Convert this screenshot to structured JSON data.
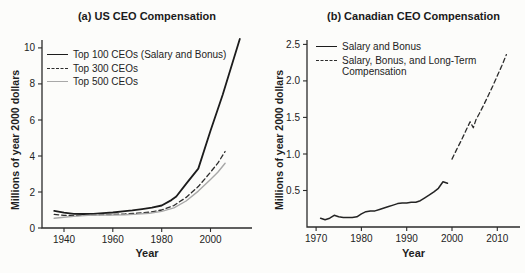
{
  "colors": {
    "background": "#fcfcfa",
    "ink": "#1f1f1f",
    "axis": "#2b2b2b",
    "gray_line": "#a8a8a8"
  },
  "chart_data": [
    {
      "type": "line",
      "title": "(a) US CEO Compensation",
      "xlabel": "Year",
      "ylabel": "Millions of year 2000 dollars",
      "xlim": [
        1931,
        2017
      ],
      "ylim": [
        0,
        10.44
      ],
      "xticks": [
        1940,
        1960,
        1980,
        2000
      ],
      "xtick_labels": [
        "1940",
        "1960",
        "1980",
        "2000"
      ],
      "yticks": [
        0,
        2,
        4,
        6,
        8,
        10
      ],
      "ytick_labels": [
        "0",
        "2",
        "4",
        "6",
        "8",
        "10"
      ],
      "grid": false,
      "legend_position": "upper-left-inside",
      "axis_color": "#2b2b2b",
      "series": [
        {
          "name": "Top 100 CEOs (Salary and Bonus)",
          "style": "solid",
          "color": "#1c1c1c",
          "width": 1.8,
          "x": [
            1936,
            1940,
            1944,
            1948,
            1952,
            1956,
            1960,
            1964,
            1968,
            1972,
            1976,
            1980,
            1984,
            1986,
            1990,
            1995,
            2000,
            2005,
            2012
          ],
          "y": [
            0.95,
            0.85,
            0.79,
            0.78,
            0.79,
            0.82,
            0.86,
            0.92,
            0.98,
            1.05,
            1.13,
            1.25,
            1.55,
            1.75,
            2.45,
            3.3,
            5.4,
            7.4,
            10.5
          ]
        },
        {
          "name": "Top 300 CEOs",
          "style": "dashed",
          "color": "#2d2d2d",
          "width": 1.3,
          "x": [
            1936,
            1940,
            1945,
            1950,
            1955,
            1960,
            1965,
            1970,
            1975,
            1980,
            1985,
            1990,
            1995,
            2000,
            2003,
            2006
          ],
          "y": [
            0.76,
            0.7,
            0.69,
            0.72,
            0.74,
            0.75,
            0.78,
            0.82,
            0.88,
            1.0,
            1.25,
            1.7,
            2.3,
            3.1,
            3.6,
            4.25
          ]
        },
        {
          "name": "Top 500 CEOs",
          "style": "solid",
          "color": "#a8a8a8",
          "width": 1.4,
          "x": [
            1936,
            1940,
            1945,
            1950,
            1955,
            1960,
            1965,
            1970,
            1975,
            1980,
            1985,
            1990,
            1995,
            2000,
            2003,
            2006
          ],
          "y": [
            0.54,
            0.6,
            0.66,
            0.7,
            0.72,
            0.72,
            0.74,
            0.77,
            0.82,
            0.92,
            1.12,
            1.5,
            2.05,
            2.7,
            3.1,
            3.6
          ]
        }
      ]
    },
    {
      "type": "line",
      "title": "(b) Canadian CEO Compensation",
      "xlabel": "Year",
      "ylabel": "Millions of year 2000 dollars",
      "xlim": [
        1968,
        2015
      ],
      "ylim": [
        0,
        2.56
      ],
      "xticks": [
        1970,
        1980,
        1990,
        2000,
        2010
      ],
      "xtick_labels": [
        "1970",
        "1980",
        "1990",
        "2000",
        "2010"
      ],
      "yticks": [
        0.5,
        1.0,
        1.5,
        2.0,
        2.5
      ],
      "ytick_labels": [
        "0.5",
        "1.0",
        "1.5",
        "2.0",
        "2.5"
      ],
      "grid": false,
      "legend_position": "upper-left-inside",
      "axis_color": "#2b2b2b",
      "series": [
        {
          "name": "Salary and Bonus",
          "style": "solid",
          "color": "#242424",
          "width": 1.5,
          "x": [
            1971,
            1972,
            1973,
            1974,
            1975,
            1976,
            1977,
            1978,
            1979,
            1980,
            1981,
            1982,
            1983,
            1984,
            1985,
            1986,
            1987,
            1988,
            1989,
            1990,
            1991,
            1992,
            1993,
            1994,
            1995,
            1996,
            1997,
            1998,
            1999
          ],
          "y": [
            0.12,
            0.1,
            0.12,
            0.16,
            0.14,
            0.13,
            0.13,
            0.13,
            0.14,
            0.18,
            0.21,
            0.22,
            0.22,
            0.24,
            0.26,
            0.28,
            0.3,
            0.32,
            0.33,
            0.33,
            0.34,
            0.34,
            0.36,
            0.4,
            0.44,
            0.48,
            0.53,
            0.62,
            0.6
          ]
        },
        {
          "name": "Salary, Bonus, and Long-Term Compensation",
          "legend_lines": [
            "Salary, Bonus, and Long-Term",
            "Compensation"
          ],
          "style": "dashed",
          "color": "#2d2d2d",
          "width": 1.3,
          "x": [
            2000,
            2001,
            2002,
            2003,
            2004,
            2004.7,
            2005.3,
            2006,
            2007,
            2008,
            2009,
            2010,
            2011,
            2012
          ],
          "y": [
            0.93,
            1.06,
            1.18,
            1.31,
            1.44,
            1.36,
            1.47,
            1.55,
            1.67,
            1.8,
            1.93,
            2.07,
            2.21,
            2.36
          ]
        }
      ]
    }
  ]
}
